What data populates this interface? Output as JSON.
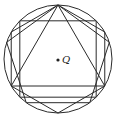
{
  "diagram": {
    "title": "",
    "center_label": "Q",
    "circle": {
      "cx": 58,
      "cy": 59,
      "r": 54
    },
    "polygons": [
      {
        "name": "triangle",
        "sides": 3,
        "rotation_deg": -90
      },
      {
        "name": "square",
        "sides": 4,
        "rotation_deg": -45
      },
      {
        "name": "pentagon",
        "sides": 5,
        "rotation_deg": -90
      },
      {
        "name": "hexagon",
        "sides": 6,
        "rotation_deg": -90
      }
    ],
    "stroke_color": "#2a2a2a"
  }
}
